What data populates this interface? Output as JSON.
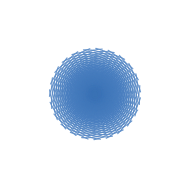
{
  "figure": {
    "name": "double-logarithmic-spiral-grid",
    "background_color": "#ffffff",
    "width": 190,
    "height": 194
  },
  "chart_data": {
    "type": "line",
    "subtitle": "",
    "xlabel": "",
    "ylabel": "",
    "grid": false,
    "legend": null,
    "tick_labels": [],
    "annotations": [],
    "xlim": [
      12,
      178
    ],
    "ylim": [
      12,
      178
    ],
    "center": {
      "x": 95,
      "y": 94
    },
    "outer_radius": 83,
    "inner_radius": 1.6,
    "arm_count": 23,
    "families": [
      {
        "name": "clockwise-spirals",
        "direction": "cw",
        "pitch_b": 0.2035,
        "turns": 2.62,
        "count": 23,
        "color": "#4a7fc0"
      },
      {
        "name": "counterclockwise-spirals",
        "direction": "ccw",
        "pitch_b": 0.2035,
        "turns": 2.62,
        "count": 23,
        "color": "#4a7fc0"
      }
    ],
    "stroke": {
      "core_color": "#3a72b5",
      "mid_color": "#4a7fc0",
      "edge_color": "#93b4da",
      "core_width": 1.55,
      "edge_width": 0.85
    },
    "phase_offset_deg": 9
  }
}
